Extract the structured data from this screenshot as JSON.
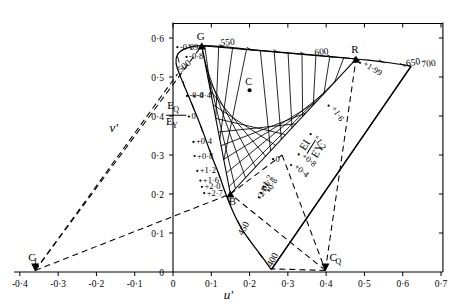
{
  "figure": {
    "kind": "cie-uv-chromaticity-diagram",
    "background": "#ffffff",
    "ink": "#000000"
  },
  "axes": {
    "xlabel": "u'",
    "ylabel": "v'",
    "xticks": [
      "-0·4",
      "-0·3",
      "-0·2",
      "-0·1",
      "0",
      "0·1",
      "0·2",
      "0·3",
      "0·4",
      "0·5",
      "0·6",
      "0·7"
    ],
    "xtick_values": [
      -0.4,
      -0.3,
      -0.2,
      -0.1,
      0,
      0.1,
      0.2,
      0.3,
      0.4,
      0.5,
      0.6,
      0.7
    ],
    "yticks": [
      "0",
      "0·1",
      "0·2",
      "0·3",
      "0·4",
      "0·5",
      "0·6"
    ],
    "ytick_values": [
      0,
      0.1,
      0.2,
      0.3,
      0.4,
      0.5,
      0.6
    ],
    "xlim": [
      -0.42,
      0.72
    ],
    "ylim": [
      0.0,
      0.64
    ],
    "grid": false
  },
  "chart_data": {
    "type": "scatter",
    "title": "",
    "xlabel": "u'",
    "ylabel": "v'",
    "xlim": [
      -0.42,
      0.72
    ],
    "ylim": [
      0.0,
      0.64
    ],
    "spectral_locus": {
      "name": "spectral locus",
      "wavelength_labels": [
        {
          "label": "400",
          "u": 0.258,
          "v": 0.012
        },
        {
          "label": "450",
          "u": 0.182,
          "v": 0.092
        },
        {
          "label": "500",
          "u": 0.02,
          "v": 0.51
        },
        {
          "label": "550",
          "u": 0.125,
          "v": 0.58
        },
        {
          "label": "600",
          "u": 0.37,
          "v": 0.555
        },
        {
          "label": "650",
          "u": 0.61,
          "v": 0.527
        },
        {
          "label": "700",
          "u": 0.65,
          "v": 0.525
        }
      ],
      "points": [
        {
          "u": 0.257,
          "v": 0.006
        },
        {
          "u": 0.232,
          "v": 0.04
        },
        {
          "u": 0.205,
          "v": 0.075
        },
        {
          "u": 0.18,
          "v": 0.11
        },
        {
          "u": 0.158,
          "v": 0.152
        },
        {
          "u": 0.138,
          "v": 0.2
        },
        {
          "u": 0.12,
          "v": 0.25
        },
        {
          "u": 0.1,
          "v": 0.3
        },
        {
          "u": 0.08,
          "v": 0.355
        },
        {
          "u": 0.058,
          "v": 0.41
        },
        {
          "u": 0.036,
          "v": 0.462
        },
        {
          "u": 0.018,
          "v": 0.505
        },
        {
          "u": 0.008,
          "v": 0.535
        },
        {
          "u": 0.012,
          "v": 0.558
        },
        {
          "u": 0.03,
          "v": 0.572
        },
        {
          "u": 0.062,
          "v": 0.58
        },
        {
          "u": 0.1,
          "v": 0.58
        },
        {
          "u": 0.16,
          "v": 0.575
        },
        {
          "u": 0.23,
          "v": 0.568
        },
        {
          "u": 0.3,
          "v": 0.562
        },
        {
          "u": 0.37,
          "v": 0.556
        },
        {
          "u": 0.44,
          "v": 0.55
        },
        {
          "u": 0.51,
          "v": 0.543
        },
        {
          "u": 0.57,
          "v": 0.536
        },
        {
          "u": 0.622,
          "v": 0.528
        }
      ]
    },
    "primaries": [
      {
        "label": "G",
        "u": 0.075,
        "v": 0.58,
        "marker": "filled-triangle"
      },
      {
        "label": "R",
        "u": 0.478,
        "v": 0.546,
        "marker": "filled-triangle"
      },
      {
        "label": "B",
        "u": 0.15,
        "v": 0.2,
        "marker": "filled-triangle"
      }
    ],
    "reference_points": [
      {
        "label": "C_I",
        "u": -0.36,
        "v": 0.004,
        "marker": "filled-triangle"
      },
      {
        "label": "C_Q",
        "u": 0.398,
        "v": 0.004,
        "marker": "filled-triangle"
      },
      {
        "label": "C",
        "u": 0.2,
        "v": 0.466,
        "marker": "filled-dot"
      }
    ],
    "grid_family_q": {
      "name": "E_Q/E_Y",
      "label_numerator": "E",
      "label_num_sub": "Q",
      "label_denominator": "E",
      "label_den_sub": "Y",
      "tick_labels": [
        "-0·4",
        "0",
        "+0·4",
        "+0·8",
        "+1·2",
        "+1·6",
        "+2·0",
        "+2·7"
      ],
      "tick_values": [
        -0.4,
        0,
        0.4,
        0.8,
        1.2,
        1.6,
        2.0,
        2.7
      ],
      "tick_anchors": [
        {
          "label": "-0·4",
          "u": 0.043,
          "v": 0.445
        },
        {
          "label": "0",
          "u": 0.048,
          "v": 0.392
        },
        {
          "label": "+0·4",
          "u": 0.06,
          "v": 0.327
        },
        {
          "label": "+0·8",
          "u": 0.063,
          "v": 0.291
        },
        {
          "label": "+1·2",
          "u": 0.07,
          "v": 0.253
        },
        {
          "label": "+1·6",
          "u": 0.078,
          "v": 0.228
        },
        {
          "label": "+2·0",
          "u": 0.082,
          "v": 0.212
        },
        {
          "label": "+2·7",
          "u": 0.088,
          "v": 0.196
        }
      ]
    },
    "grid_family_i": {
      "name": "E_I/E_Y",
      "label_numerator": "E",
      "label_num_sub": "I",
      "label_denominator": "E",
      "label_den_sub": "Y",
      "tick_labels": [
        "-2·0",
        "-1·6",
        "-1·2",
        "-0·8",
        "0",
        "+0·4",
        "+0·8",
        "+1·2",
        "+1·6",
        "+1·99"
      ],
      "tick_values": [
        -2.0,
        -1.6,
        -1.2,
        -0.8,
        0,
        0.4,
        0.8,
        1.2,
        1.6,
        1.99
      ],
      "tick_anchors": [
        {
          "label": "-2·0",
          "u": 0.231,
          "v": 0.185
        },
        {
          "label": "-1·6",
          "u": 0.237,
          "v": 0.196
        },
        {
          "label": "-1·2",
          "u": 0.243,
          "v": 0.212
        },
        {
          "label": "-0·8",
          "u": 0.256,
          "v": 0.203
        },
        {
          "label": "0",
          "u": 0.268,
          "v": 0.283
        },
        {
          "label": "+0·4",
          "u": 0.315,
          "v": 0.268
        },
        {
          "label": "+0·8",
          "u": 0.335,
          "v": 0.295
        },
        {
          "label": "+1·2",
          "u": 0.366,
          "v": 0.347
        },
        {
          "label": "+1·6",
          "u": 0.413,
          "v": 0.42
        },
        {
          "label": "+1·99",
          "u": 0.495,
          "v": 0.53
        }
      ]
    },
    "locus_annotations": [
      {
        "label": "-0·89",
        "u": 0.018,
        "v": 0.57
      },
      {
        "label": "-0·8",
        "u": 0.042,
        "v": 0.545
      },
      {
        "label": "-0·4",
        "u": 0.062,
        "v": 0.445
      }
    ],
    "dashed_rays_from_CI": [
      {
        "to_u": 0.012,
        "to_v": 0.508
      },
      {
        "to_u": 0.075,
        "to_v": 0.58
      },
      {
        "to_u": 0.15,
        "to_v": 0.2
      }
    ],
    "dashed_rays_from_CQ": [
      {
        "to_u": 0.478,
        "to_v": 0.546
      },
      {
        "to_u": 0.15,
        "to_v": 0.2
      },
      {
        "to_u": 0.258,
        "to_v": 0.008
      }
    ],
    "mesh": {
      "description": "two interleaved families of straight constant-ratio lines spanning the G-R-B triangle",
      "family_q_count": 10,
      "family_i_count": 10
    }
  },
  "labels": {
    "G": "G",
    "R": "R",
    "B": "B",
    "CI": "C",
    "CI_sub": "I",
    "CQ": "C",
    "CQ_sub": "Q",
    "C": "C"
  }
}
